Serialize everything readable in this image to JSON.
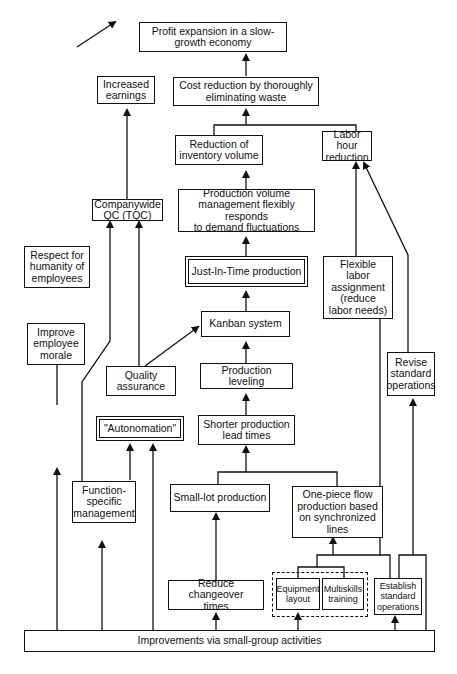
{
  "diagram": {
    "nodes": {
      "profit": "Profit expansion in a slow-\ngrowth economy",
      "earnings": "Increased\nearnings",
      "cost": "Cost reduction by thoroughly\neliminating waste",
      "inventory": "Reduction of\ninventory volume",
      "labor_hour": "Labor hour\nreduction",
      "tqc": "Companywide\nQC (TQC)",
      "prod_volume": "Production volume\nmanagement flexibly responds\nto demand fluctuations",
      "respect": "Respect for\nhumanity of\nemployees",
      "jit": "Just-In-Time production",
      "flexible_labor": "Flexible\nlabor\nassignment\n(reduce\nlabor needs)",
      "morale": "Improve\nemployee\nmorale",
      "kanban": "Kanban system",
      "quality": "Quality\nassurance",
      "leveling": "Production leveling",
      "revise": "Revise\nstandard\noperations",
      "autonomation": "\"Autonomation\"",
      "shorter_lead": "Shorter production\nlead times",
      "function_mgmt": "Function-\nspecific\nmanagement",
      "small_lot": "Small-lot production",
      "one_piece": "One-piece flow\nproduction based\non synchronized\nlines",
      "changeover": "Reduce changeover\ntimes",
      "equipment": "Equipment\nlayout",
      "multiskills": "Multiskills\ntraining",
      "establish": "Establish\nstandard\noperations",
      "improvements": "Improvements via small-group activities"
    },
    "edges": [
      [
        "earnings",
        "profit"
      ],
      [
        "cost",
        "profit"
      ],
      [
        "inventory",
        "cost"
      ],
      [
        "labor_hour",
        "cost"
      ],
      [
        "tqc",
        "earnings"
      ],
      [
        "prod_volume",
        "inventory"
      ],
      [
        "jit",
        "prod_volume"
      ],
      [
        "kanban",
        "jit"
      ],
      [
        "leveling",
        "kanban"
      ],
      [
        "quality",
        "kanban"
      ],
      [
        "quality",
        "tqc"
      ],
      [
        "function_mgmt",
        "tqc"
      ],
      [
        "shorter_lead",
        "leveling"
      ],
      [
        "small_lot",
        "shorter_lead"
      ],
      [
        "one_piece",
        "shorter_lead"
      ],
      [
        "changeover",
        "small_lot"
      ],
      [
        "equipment",
        "one_piece"
      ],
      [
        "multiskills",
        "one_piece"
      ],
      [
        "flexible_labor",
        "labor_hour"
      ],
      [
        "revise",
        "labor_hour"
      ],
      [
        "morale",
        "respect"
      ],
      [
        "function_mgmt",
        "autonomation"
      ],
      [
        "improvements",
        "autonomation"
      ],
      [
        "improvements",
        "morale"
      ],
      [
        "improvements",
        "function_mgmt"
      ],
      [
        "improvements",
        "changeover"
      ],
      [
        "improvements",
        "equipment"
      ],
      [
        "improvements",
        "establish"
      ],
      [
        "improvements",
        "flexible_labor"
      ],
      [
        "establish",
        "revise"
      ]
    ]
  }
}
